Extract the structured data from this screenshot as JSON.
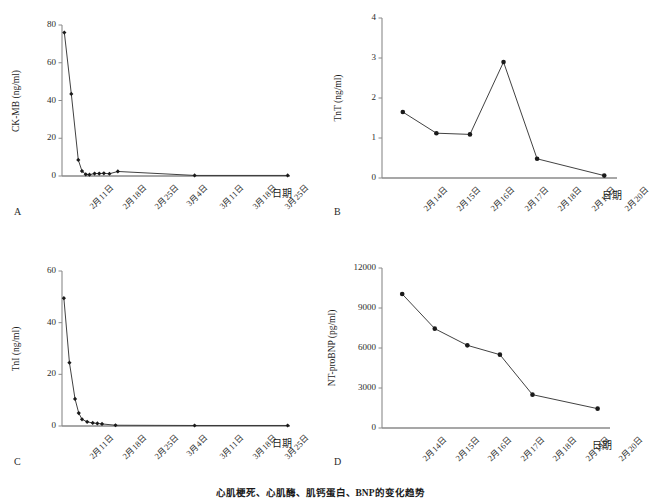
{
  "figure": {
    "caption": "心肌梗死、心肌酶、肌钙蛋白、BNP的变化趋势",
    "panels": [
      "A",
      "B",
      "C",
      "D"
    ]
  },
  "chart_data": [
    {
      "panel": "A",
      "type": "line",
      "title": "",
      "ylabel": "CK-MB (ng/ml)",
      "xlabel": "日期",
      "ylim": [
        0,
        80
      ],
      "yticks": [
        0,
        20,
        40,
        60,
        80
      ],
      "ytick_labels": [
        "0",
        "20",
        "40",
        "60",
        "80"
      ],
      "xtick_labels": [
        "2月11日",
        "2月18日",
        "2月25日",
        "3月4日",
        "3月11日",
        "3月18日",
        "3月25日"
      ],
      "xlim_days": [
        0,
        49
      ],
      "grid": false,
      "marker": "diamond",
      "points": [
        {
          "day": 0.5,
          "value": 76
        },
        {
          "day": 2.0,
          "value": 43.5
        },
        {
          "day": 3.5,
          "value": 8.5
        },
        {
          "day": 4.3,
          "value": 2.6
        },
        {
          "day": 5.1,
          "value": 0.9
        },
        {
          "day": 5.9,
          "value": 0.7
        },
        {
          "day": 7.0,
          "value": 1.3
        },
        {
          "day": 8.0,
          "value": 1.3
        },
        {
          "day": 9.0,
          "value": 1.4
        },
        {
          "day": 10.2,
          "value": 1.2
        },
        {
          "day": 12.0,
          "value": 2.4
        },
        {
          "day": 28.5,
          "value": 0.3
        },
        {
          "day": 48.5,
          "value": 0.3
        }
      ]
    },
    {
      "panel": "B",
      "type": "line",
      "title": "",
      "ylabel": "TnT (ng/ml)",
      "xlabel": "日期",
      "ylim": [
        0,
        4
      ],
      "yticks": [
        0,
        1,
        2,
        3,
        4
      ],
      "ytick_labels": [
        "0",
        "1",
        "2",
        "3",
        "4"
      ],
      "xtick_labels": [
        "2月14日",
        "2月15日",
        "2月16日",
        "2月17日",
        "2月18日",
        "2月19日",
        "2月20日"
      ],
      "grid": false,
      "marker": "circle",
      "categories": [
        "2月14日",
        "2月15日",
        "2月16日",
        "2月17日",
        "2月18日",
        "2月19日",
        "2月20日"
      ],
      "points": [
        {
          "index": 0,
          "value": 1.65
        },
        {
          "index": 1,
          "value": 1.12
        },
        {
          "index": 2,
          "value": 1.09
        },
        {
          "index": 3,
          "value": 2.9
        },
        {
          "index": 4,
          "value": 0.48
        },
        {
          "index": 6,
          "value": 0.06
        }
      ]
    },
    {
      "panel": "C",
      "type": "line",
      "title": "",
      "ylabel": "TnI (ng/ml)",
      "xlabel": "日期",
      "ylim": [
        0,
        60
      ],
      "yticks": [
        0,
        20,
        40,
        60
      ],
      "ytick_labels": [
        "0",
        "20",
        "40",
        "60"
      ],
      "xtick_labels": [
        "2月11日",
        "2月18日",
        "2月25日",
        "3月4日",
        "3月11日",
        "3月18日",
        "3月25日"
      ],
      "xlim_days": [
        0,
        49
      ],
      "grid": false,
      "marker": "diamond",
      "points": [
        {
          "day": 0.4,
          "value": 49.5
        },
        {
          "day": 1.6,
          "value": 24.5
        },
        {
          "day": 2.8,
          "value": 10.5
        },
        {
          "day": 3.6,
          "value": 5.0
        },
        {
          "day": 4.3,
          "value": 2.6
        },
        {
          "day": 5.4,
          "value": 1.6
        },
        {
          "day": 6.6,
          "value": 1.2
        },
        {
          "day": 7.6,
          "value": 1.0
        },
        {
          "day": 8.6,
          "value": 0.8
        },
        {
          "day": 11.5,
          "value": 0.3
        },
        {
          "day": 28.5,
          "value": 0.2
        },
        {
          "day": 48.5,
          "value": 0.2
        }
      ]
    },
    {
      "panel": "D",
      "type": "line",
      "title": "",
      "ylabel": "NT-proBNP (pg/ml)",
      "xlabel": "日期",
      "ylim": [
        0,
        12000
      ],
      "yticks": [
        0,
        3000,
        6000,
        9000,
        12000
      ],
      "ytick_labels": [
        "0",
        "3000",
        "6000",
        "9000",
        "12000"
      ],
      "xtick_labels": [
        "2月14日",
        "2月15日",
        "2月16日",
        "2月17日",
        "2月18日",
        "2月19日",
        "2月20日"
      ],
      "grid": false,
      "marker": "circle",
      "categories": [
        "2月14日",
        "2月15日",
        "2月16日",
        "2月17日",
        "2月18日",
        "2月19日",
        "2月20日"
      ],
      "points": [
        {
          "index": 0,
          "value": 10050
        },
        {
          "index": 1,
          "value": 7450
        },
        {
          "index": 2,
          "value": 6200
        },
        {
          "index": 3,
          "value": 5500
        },
        {
          "index": 4,
          "value": 2500
        },
        {
          "index": 6,
          "value": 1450
        }
      ]
    }
  ]
}
